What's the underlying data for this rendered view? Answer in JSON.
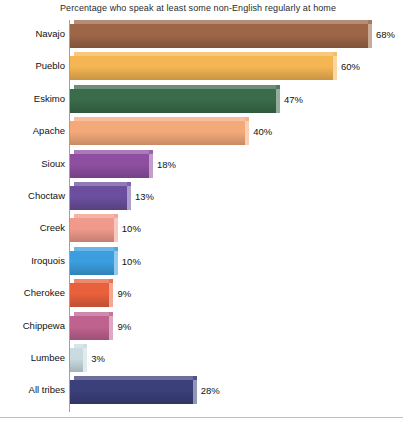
{
  "chart_data": {
    "type": "bar",
    "orientation": "horizontal",
    "title": "Percentage who speak at least some non-English regularly at home",
    "xlabel": "",
    "ylabel": "",
    "xlim": [
      0,
      68
    ],
    "grid": false,
    "legend": "none",
    "value_suffix": "%",
    "categories": [
      "Navajo",
      "Pueblo",
      "Eskimo",
      "Apache",
      "Sioux",
      "Choctaw",
      "Creek",
      "Iroquois",
      "Cherokee",
      "Chippewa",
      "Lumbee",
      "All tribes"
    ],
    "values": [
      68,
      60,
      47,
      40,
      18,
      13,
      10,
      10,
      9,
      9,
      3,
      28
    ],
    "value_labels": [
      "68%",
      "60%",
      "47%",
      "40%",
      "18%",
      "13%",
      "10%",
      "10%",
      "9%",
      "9%",
      "3%",
      "28%"
    ],
    "bar_colors": [
      "#9c6647",
      "#f5b553",
      "#3a6b4a",
      "#f4a97a",
      "#8e4fa0",
      "#6b4f9e",
      "#f09a8c",
      "#3b9ede",
      "#e8603c",
      "#c0628f",
      "#c9dbe0",
      "#3b3f7a"
    ]
  }
}
